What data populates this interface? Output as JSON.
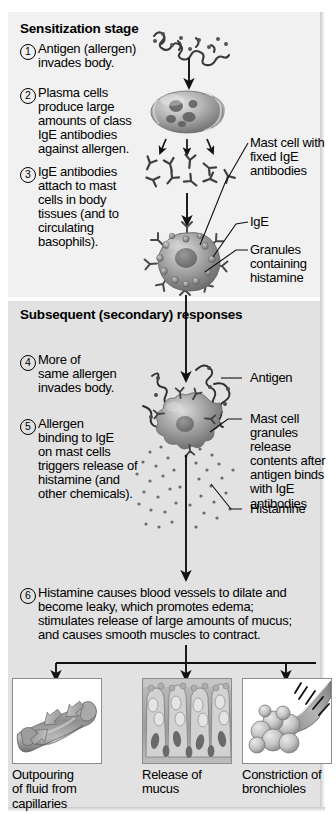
{
  "figure": {
    "title_alt": "Mechanism of an acute allergic (immediate hypersensitivity) response"
  },
  "stages": [
    {
      "id": "sensitization",
      "heading": "Sensitization stage",
      "steps": [
        {
          "number": "1",
          "text": "Antigen (allergen)\ninvades body."
        },
        {
          "number": "2",
          "text": "Plasma cells\nproduce large\namounts of class\nIgE antibodies\nagainst allergen."
        },
        {
          "number": "3",
          "text": "IgE antibodies\nattach to mast\ncells in body\ntissues (and to\ncirculating\nbasophils)."
        }
      ],
      "callouts": [
        {
          "name": "mast-cell-with-fixed-ige",
          "text": "Mast cell with\nfixed IgE\nantibodies"
        },
        {
          "name": "ige",
          "text": "IgE"
        },
        {
          "name": "granules-containing-histamine",
          "text": "Granules\ncontaining\nhistamine"
        }
      ]
    },
    {
      "id": "subsequent",
      "heading": "Subsequent\n(secondary)\nresponses",
      "steps": [
        {
          "number": "4",
          "text": "More of\nsame allergen\ninvades body."
        },
        {
          "number": "5",
          "text": "Allergen\nbinding to IgE\non mast cells\ntriggers release of\nhistamine (and\nother chemicals)."
        }
      ],
      "callouts": [
        {
          "name": "antigen",
          "text": "Antigen"
        },
        {
          "name": "mast-cell-granules-release",
          "text": "Mast cell\ngranules release\ncontents after\nantigen binds\nwith IgE\nantibodies"
        },
        {
          "name": "histamine",
          "text": "Histamine"
        }
      ]
    }
  ],
  "summary_step": {
    "number": "6",
    "text": "Histamine causes blood vessels to dilate and\nbecome leaky, which promotes edema;\nstimulates release of large amounts of mucus;\nand causes smooth muscles to contract."
  },
  "outcomes": [
    {
      "name": "outpouring-of-fluid-from-capillaries",
      "caption": "Outpouring\nof fluid from\ncapillaries",
      "image": "capillary-leaking-fluid"
    },
    {
      "name": "release-of-mucus",
      "caption": "Release of\nmucus",
      "image": "mucus-secreting-epithelium"
    },
    {
      "name": "constriction-of-bronchioles",
      "caption": "Constriction of\nbronchioles",
      "image": "constricted-bronchiole-with-alveoli"
    }
  ],
  "colors": {
    "panel_top": "#f1f1f1",
    "panel_bottom": "#e2e2e2",
    "ink": "#000000",
    "cell_gray": "#9a9a9a",
    "box_border": "#8d8d8d"
  }
}
